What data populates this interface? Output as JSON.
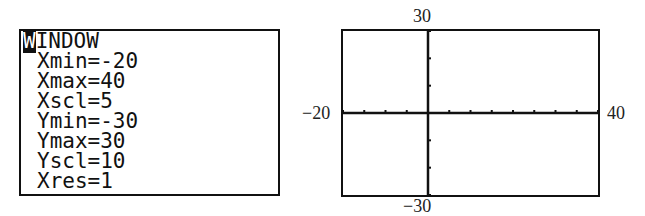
{
  "window_screen": {
    "title": "WINDOW",
    "settings": [
      {
        "label": "Xmin",
        "value": "-20"
      },
      {
        "label": "Xmax",
        "value": "40"
      },
      {
        "label": "Xscl",
        "value": "5"
      },
      {
        "label": "Ymin",
        "value": "-30"
      },
      {
        "label": "Ymax",
        "value": "30"
      },
      {
        "label": "Yscl",
        "value": "10"
      },
      {
        "label": "Xres",
        "value": "1"
      }
    ],
    "lines": [
      "Xmin=-20",
      "Xmax=40",
      "Xscl=5",
      "Ymin=-30",
      "Ymax=30",
      "Yscl=10",
      "Xres=1"
    ]
  },
  "graph": {
    "xmin_label": "−20",
    "xmax_label": "40",
    "ymin_label": "−30",
    "ymax_label": "30",
    "xmin": -20,
    "xmax": 40,
    "xscl": 5,
    "ymin": -30,
    "ymax": 30,
    "yscl": 10
  }
}
